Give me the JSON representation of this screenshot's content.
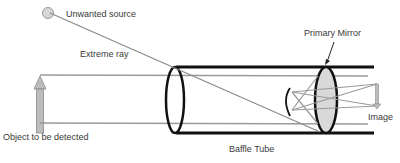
{
  "diagram": {
    "type": "optical-schematic",
    "labels": {
      "unwanted_source": "Unwanted source",
      "extreme_ray": "Extreme ray",
      "primary_mirror": "Primary Mirror",
      "object": "Object to be detected",
      "baffle_tube": "Baffle Tube",
      "image": "Image"
    },
    "colors": {
      "outline": "#111111",
      "ray": "#9a9a9a",
      "mirror_fill": "#d9d9d9",
      "arrow_fill": "#bdbdbd",
      "source_fill": "#d6d6d6",
      "text": "#3a3a3a"
    }
  }
}
